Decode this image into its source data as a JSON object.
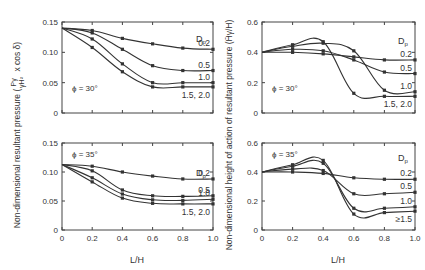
{
  "chart_data": [
    {
      "type": "line",
      "panel": "left-top",
      "title": "",
      "annotation": "ϕ = 30°",
      "legend_title": "Dp",
      "xlabel": "L/H",
      "ylabel": "Non-dimensional resultant pressure (Pγ / γH² x cos δ)",
      "x": [
        0,
        0.2,
        0.4,
        0.6,
        0.8,
        1.0
      ],
      "xlim": [
        0,
        1.0
      ],
      "ylim": [
        0,
        0.15
      ],
      "yticks": [
        0,
        0.05,
        0.1,
        0.15
      ],
      "series": [
        {
          "name": "0.2",
          "values": [
            0.14,
            0.136,
            0.123,
            0.114,
            0.107,
            0.105
          ]
        },
        {
          "name": "0.5",
          "values": [
            0.14,
            0.132,
            0.105,
            0.078,
            0.07,
            0.07
          ]
        },
        {
          "name": "1.0",
          "values": [
            0.14,
            0.122,
            0.081,
            0.05,
            0.05,
            0.05
          ]
        },
        {
          "name": "1.5, 2.0",
          "values": [
            0.14,
            0.108,
            0.068,
            0.043,
            0.043,
            0.043
          ]
        }
      ]
    },
    {
      "type": "line",
      "panel": "left-bottom",
      "annotation": "ϕ = 35°",
      "legend_title": "Dp",
      "xlabel": "L/H",
      "x": [
        0,
        0.2,
        0.4,
        0.6,
        0.8,
        1.0
      ],
      "xlim": [
        0,
        1.0
      ],
      "ylim": [
        0,
        0.15
      ],
      "yticks": [
        0,
        0.05,
        0.1,
        0.15
      ],
      "xticks": [
        "0",
        "0.2",
        "0.4",
        "0.6",
        "0.8",
        "1.0"
      ],
      "series": [
        {
          "name": "0.2",
          "values": [
            0.113,
            0.11,
            0.1,
            0.093,
            0.088,
            0.088
          ]
        },
        {
          "name": "0.5",
          "values": [
            0.113,
            0.102,
            0.069,
            0.059,
            0.058,
            0.059
          ]
        },
        {
          "name": "1.0",
          "values": [
            0.113,
            0.09,
            0.062,
            0.052,
            0.051,
            0.053
          ]
        },
        {
          "name": "1.5, 2.0",
          "values": [
            0.113,
            0.083,
            0.055,
            0.046,
            0.045,
            0.045
          ]
        }
      ]
    },
    {
      "type": "line",
      "panel": "right-top",
      "annotation": "ϕ = 30°",
      "legend_title": "Dp",
      "xlabel": "L/H",
      "ylabel": "Non-dimensional height of action of resultant pressure (H̄γ/H)",
      "x": [
        0,
        0.2,
        0.4,
        0.6,
        0.8,
        1.0
      ],
      "xlim": [
        0,
        1.0
      ],
      "ylim": [
        0,
        0.6
      ],
      "yticks": [
        0,
        0.2,
        0.4,
        0.6
      ],
      "series": [
        {
          "name": "0.2",
          "values": [
            0.4,
            0.4,
            0.39,
            0.37,
            0.35,
            0.35
          ]
        },
        {
          "name": "0.5",
          "values": [
            0.4,
            0.42,
            0.41,
            0.35,
            0.27,
            0.26
          ]
        },
        {
          "name": "1.0",
          "values": [
            0.4,
            0.44,
            0.46,
            0.41,
            0.15,
            0.14
          ]
        },
        {
          "name": "1.5, 2.0",
          "values": [
            0.4,
            0.45,
            0.47,
            0.13,
            0.11,
            0.11
          ]
        }
      ]
    },
    {
      "type": "line",
      "panel": "right-bottom",
      "annotation": "ϕ = 35°",
      "legend_title": "Dp",
      "xlabel": "L/H",
      "x": [
        0,
        0.2,
        0.4,
        0.6,
        0.8,
        1.0
      ],
      "xlim": [
        0,
        1.0
      ],
      "ylim": [
        0,
        0.6
      ],
      "yticks": [
        0,
        0.2,
        0.4,
        0.6
      ],
      "xticks": [
        "0",
        "0.2",
        "0.4",
        "0.6",
        "0.8",
        "1.0"
      ],
      "series": [
        {
          "name": "0.2",
          "values": [
            0.4,
            0.4,
            0.39,
            0.36,
            0.35,
            0.35
          ]
        },
        {
          "name": "0.5",
          "values": [
            0.4,
            0.42,
            0.41,
            0.25,
            0.25,
            0.26
          ]
        },
        {
          "name": "1.0",
          "values": [
            0.4,
            0.44,
            0.46,
            0.15,
            0.15,
            0.16
          ]
        },
        {
          "name": "≥1.5",
          "values": [
            0.4,
            0.45,
            0.48,
            0.11,
            0.12,
            0.13
          ]
        }
      ]
    }
  ],
  "labels": {
    "left_ylabel": "Non-dimensional resultant pressure (",
    "left_ylabel_frac_num": "Pγ",
    "left_ylabel_frac_den": "γH²",
    "left_ylabel_tail": "x cos δ)",
    "right_ylabel": "Non-dimensional height of action of resultant pressure (H̄γ/H)",
    "xlabel": "L/H",
    "phi30": "ϕ = 30°",
    "phi35": "ϕ = 35°",
    "legend_title": "D",
    "legend_sub": "p"
  }
}
